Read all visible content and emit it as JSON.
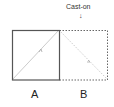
{
  "diagram": {
    "annotation": "Cast-on",
    "annotation_arrow": "↓",
    "panels": [
      {
        "label": "A",
        "border": "solid",
        "diagonal": "bottom-left to top-right"
      },
      {
        "label": "B",
        "border": "dotted",
        "diagonal": "top-left to bottom-right"
      }
    ],
    "colors": {
      "solid_border": "#555555",
      "dotted_border": "#666666",
      "diagonal": "#c8c8c8",
      "text": "#222222"
    }
  }
}
